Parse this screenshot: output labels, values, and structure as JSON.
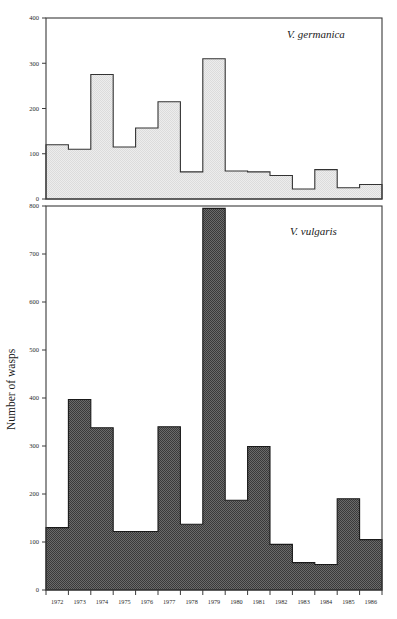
{
  "figure": {
    "ylabel": "Number of wasps",
    "background": "#ffffff",
    "frame_color": "#3a3a3a"
  },
  "chart_data": [
    {
      "type": "bar",
      "title": "",
      "panel": "top",
      "series_label": "V. germanica",
      "xlabel": "",
      "ylabel": "Number of wasps",
      "categories": [
        "1972",
        "1973",
        "1974",
        "1975",
        "1976",
        "1977",
        "1978",
        "1979",
        "1980",
        "1981",
        "1982",
        "1983",
        "1984",
        "1985",
        "1986"
      ],
      "values": [
        120,
        110,
        275,
        115,
        157,
        215,
        60,
        310,
        62,
        60,
        52,
        22,
        65,
        25,
        32
      ],
      "ylim": [
        0,
        400
      ],
      "yticks": [
        0,
        100,
        200,
        300,
        400
      ],
      "ytick_labels": [
        "0",
        "100",
        "200",
        "300",
        "400"
      ],
      "grid": false,
      "legend": "inside-top-right",
      "fill_color": "#e8e8e8",
      "edge_color": "#333333",
      "style": "step-histogram"
    },
    {
      "type": "bar",
      "title": "",
      "panel": "bottom",
      "series_label": "V. vulgaris",
      "xlabel": "",
      "ylabel": "Number of wasps",
      "categories": [
        "1972",
        "1973",
        "1974",
        "1975",
        "1976",
        "1977",
        "1978",
        "1979",
        "1980",
        "1981",
        "1982",
        "1983",
        "1984",
        "1985",
        "1986"
      ],
      "values": [
        130,
        397,
        338,
        122,
        122,
        340,
        137,
        795,
        187,
        299,
        95,
        57,
        53,
        190,
        105
      ],
      "ylim": [
        0,
        800
      ],
      "yticks": [
        0,
        100,
        200,
        300,
        400,
        500,
        600,
        700,
        800
      ],
      "ytick_labels": [
        "0",
        "100",
        "200",
        "300",
        "400",
        "500",
        "600",
        "700",
        "800"
      ],
      "grid": false,
      "legend": "inside-top-right",
      "fill_color": "#5e5e5e",
      "edge_color": "#1a1a1a",
      "style": "step-histogram"
    }
  ]
}
